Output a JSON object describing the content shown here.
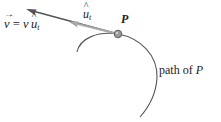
{
  "diagram": {
    "labels": {
      "velocity_equation": {
        "lhs": "v",
        "equals": " = ",
        "rhs_scalar": "v",
        "rhs_unit": "u",
        "rhs_sub": "t"
      },
      "unit_tangent": {
        "base": "u",
        "sub": "t"
      },
      "point": "P",
      "path": {
        "text": "path of ",
        "var": "P"
      }
    },
    "colors": {
      "velocity_arrow": "#555555",
      "unit_tangent_arrow": "#a8a8a8",
      "path_curve": "#555555",
      "point_fill": "#9a9a9a",
      "point_stroke": "#555555",
      "text": "#222222"
    },
    "geometry": {
      "point_P": [
        118,
        34
      ],
      "velocity_tip": [
        27,
        9
      ],
      "unit_tangent_tip": [
        70,
        22
      ]
    }
  }
}
